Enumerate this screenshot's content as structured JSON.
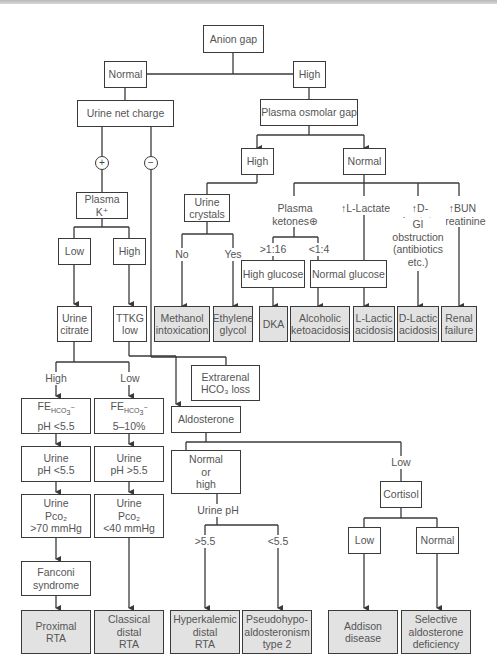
{
  "diagram": {
    "title": "Anion gap",
    "nodes": {
      "anion_gap": "Anion gap",
      "normal": "Normal",
      "high": "High",
      "urine_net_charge": "Urine net charge",
      "plasma_osmolar_gap": "Plasma osmolar gap",
      "pog_high": "High",
      "pog_normal": "Normal",
      "urine_crystals": "Urine\ncrystals",
      "plasma_k": "Plasma K⁺",
      "k_low": "Low",
      "k_high": "High",
      "urine_citrate": "Urine\ncitrate",
      "ttkg_low": "TTKG\nlow",
      "methanol": "Methanol\nintoxication",
      "ethylene_glycol": "Ethylene\nglycol",
      "high_glucose": "High glucose",
      "normal_glucose": "Normal glucose",
      "dka": "DKA",
      "alcoholic_ketoacidosis": "Alcoholic\nketoacidosis",
      "l_lactic": "L-Lactic\nacidosis",
      "d_lactic": "D-Lactic\nacidosis",
      "renal_failure": "Renal\nfailure",
      "extrarenal": "Extrarenal\nHCO₃ loss",
      "fe_hco3_high": "FE HCO₃⁻\npH <5.5",
      "fe_hco3_low": "FE HCO₃⁻\n5–10%",
      "aldosterone": "Aldosterone",
      "urine_ph_lt": "Urine\npH <5.5",
      "urine_ph_gt": "Urine\npH >5.5",
      "normal_or_high": "Normal\nor\nhigh",
      "urine_pco2_high": "Urine\nPco₂\n>70 mmHg",
      "urine_pco2_low": "Urine\nPco₂\n<40 mmHg",
      "cortisol": "Cortisol",
      "cortisol_low": "Low",
      "cortisol_normal": "Normal",
      "fanconi": "Fanconi\nsyndrome",
      "proximal_rta": "Proximal\nRTA",
      "classical_distal_rta": "Classical\ndistal\nRTA",
      "hyperkalemic_distal_rta": "Hyperkalemic\ndistal\nRTA",
      "pseudohypo": "Pseudohypo-\naldosteronism\ntype 2",
      "addison": "Addison\ndisease",
      "selective_aldo": "Selective\naldosterone\ndeficiency"
    },
    "edge_labels": {
      "plus": "+",
      "minus": "−",
      "no": "No",
      "yes": "Yes",
      "plasma_ketones": "Plasma ketones⊕",
      "l_lactate": "↑L-Lactate",
      "d_lactate": "↑D-Lactate",
      "bun": "↑BUN\ncreatinine",
      "gt_1_16": ">1:16",
      "lt_1_4": "<1:4",
      "gi_obstruction": "GI\nobstruction\n(antibiotics\netc.)",
      "citrate_high": "High",
      "citrate_low": "Low",
      "aldo_low": "Low",
      "urine_ph": "Urine pH",
      "ph_gt": ">5.5",
      "ph_lt": "<5.5"
    },
    "colors": {
      "line": "#3a3a3a",
      "outcome_fill": "#e2e2e2",
      "text": "#555555"
    }
  }
}
